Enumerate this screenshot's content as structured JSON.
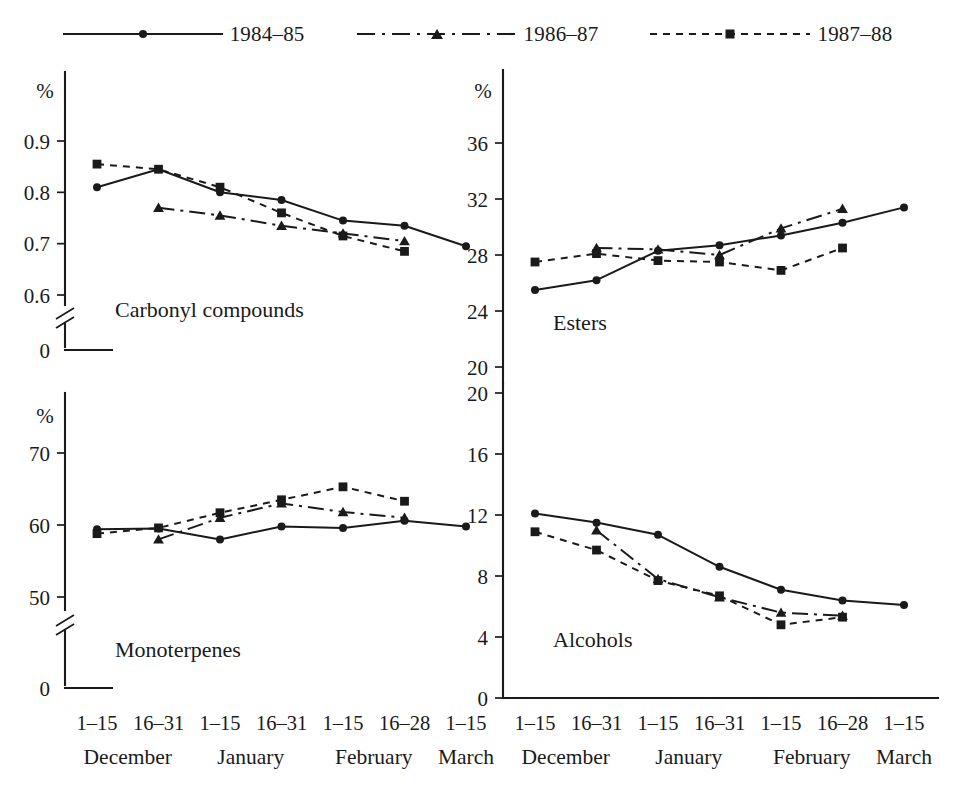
{
  "legend": {
    "entries": [
      {
        "label": "1984–85",
        "marker": "circle",
        "dash": "solid"
      },
      {
        "label": "1986–87",
        "marker": "triangle",
        "dash": "dashdot"
      },
      {
        "label": "1987–88",
        "marker": "square",
        "dash": "dotted"
      }
    ]
  },
  "axis": {
    "percent_symbol": "%",
    "zero_label": "0",
    "tick_labels": [
      "1–15",
      "16–31",
      "1–15",
      "16–31",
      "1–15",
      "16–28",
      "1–15"
    ],
    "month_labels": [
      "December",
      "January",
      "February",
      "March"
    ]
  },
  "chart_data": [
    {
      "type": "line",
      "title": "Carbonyl compounds",
      "xlabel": "",
      "ylabel": "%",
      "ylim": [
        0.55,
        0.93
      ],
      "yticks": [
        0.6,
        0.7,
        0.8,
        0.9
      ],
      "ytick_labels": [
        "0.6",
        "0.7",
        "0.8",
        "0.9"
      ],
      "axis_break": true,
      "grid": false,
      "legend_position": "top-center",
      "categories": [
        "1–15 December",
        "16–31 December",
        "1–15 January",
        "16–31 January",
        "1–15 February",
        "16–28 February",
        "1–15 March"
      ],
      "series": [
        {
          "name": "1984–85",
          "marker": "circle",
          "dash": "solid",
          "x": [
            0,
            1,
            2,
            3,
            4,
            5,
            6
          ],
          "values": [
            0.81,
            0.845,
            0.8,
            0.785,
            0.745,
            0.735,
            0.695
          ]
        },
        {
          "name": "1986–87",
          "marker": "triangle",
          "dash": "dashdot",
          "x": [
            1,
            2,
            3,
            4,
            5
          ],
          "values": [
            0.77,
            0.755,
            0.735,
            0.72,
            0.705
          ]
        },
        {
          "name": "1987–88",
          "marker": "square",
          "dash": "dotted",
          "x": [
            0,
            1,
            2,
            3,
            4,
            5
          ],
          "values": [
            0.855,
            0.845,
            0.81,
            0.76,
            0.715,
            0.685
          ]
        }
      ]
    },
    {
      "type": "line",
      "title": "Esters",
      "xlabel": "",
      "ylabel": "%",
      "ylim": [
        19.0,
        38.0
      ],
      "yticks": [
        20,
        24,
        28,
        32,
        36
      ],
      "ytick_labels": [
        "20",
        "24",
        "28",
        "32",
        "36"
      ],
      "axis_break": false,
      "grid": false,
      "legend_position": "top-center",
      "categories": [
        "1–15 December",
        "16–31 December",
        "1–15 January",
        "16–31 January",
        "1–15 February",
        "16–28 February",
        "1–15 March"
      ],
      "series": [
        {
          "name": "1984–85",
          "marker": "circle",
          "dash": "solid",
          "x": [
            0,
            1,
            2,
            3,
            4,
            5,
            6
          ],
          "values": [
            25.5,
            26.2,
            28.3,
            28.7,
            29.4,
            30.3,
            31.4
          ]
        },
        {
          "name": "1986–87",
          "marker": "triangle",
          "dash": "dashdot",
          "x": [
            1,
            2,
            3,
            4,
            5
          ],
          "values": [
            28.5,
            28.4,
            28.0,
            29.9,
            31.3
          ]
        },
        {
          "name": "1987–88",
          "marker": "square",
          "dash": "dotted",
          "x": [
            0,
            1,
            2,
            3,
            4,
            5
          ],
          "values": [
            27.5,
            28.1,
            27.6,
            27.5,
            26.9,
            28.5
          ]
        }
      ]
    },
    {
      "type": "line",
      "title": "Monoterpenes",
      "xlabel": "",
      "ylabel": "%",
      "ylim": [
        46.0,
        74.0
      ],
      "yticks": [
        50,
        60,
        70
      ],
      "ytick_labels": [
        "50",
        "60",
        "70"
      ],
      "axis_break": true,
      "grid": false,
      "legend_position": "top-center",
      "categories": [
        "1–15 December",
        "16–31 December",
        "1–15 January",
        "16–31 January",
        "1–15 February",
        "16–28 February",
        "1–15 March"
      ],
      "series": [
        {
          "name": "1984–85",
          "marker": "circle",
          "dash": "solid",
          "x": [
            0,
            1,
            2,
            3,
            4,
            5,
            6
          ],
          "values": [
            59.4,
            59.5,
            58.0,
            59.8,
            59.6,
            60.6,
            59.8
          ]
        },
        {
          "name": "1986–87",
          "marker": "triangle",
          "dash": "dashdot",
          "x": [
            1,
            2,
            3,
            4,
            5
          ],
          "values": [
            58.0,
            61.0,
            63.0,
            61.8,
            61.0
          ]
        },
        {
          "name": "1987–88",
          "marker": "square",
          "dash": "dotted",
          "x": [
            0,
            1,
            2,
            3,
            4,
            5
          ],
          "values": [
            58.8,
            59.6,
            61.7,
            63.5,
            65.3,
            63.3
          ]
        }
      ]
    },
    {
      "type": "line",
      "title": "Alcohols",
      "xlabel": "",
      "ylabel": "",
      "ylim": [
        0,
        21.5
      ],
      "yticks": [
        0,
        4,
        8,
        12,
        16,
        20
      ],
      "ytick_labels": [
        "0",
        "4",
        "8",
        "12",
        "16",
        "20"
      ],
      "axis_break": false,
      "grid": false,
      "legend_position": "top-center",
      "categories": [
        "1–15 December",
        "16–31 December",
        "1–15 January",
        "16–31 January",
        "1–15 February",
        "16–28 February",
        "1–15 March"
      ],
      "series": [
        {
          "name": "1984–85",
          "marker": "circle",
          "dash": "solid",
          "x": [
            0,
            1,
            2,
            3,
            4,
            5,
            6
          ],
          "values": [
            12.1,
            11.5,
            10.7,
            8.6,
            7.1,
            6.4,
            6.1
          ]
        },
        {
          "name": "1986–87",
          "marker": "triangle",
          "dash": "dashdot",
          "x": [
            1,
            2,
            3,
            4,
            5
          ],
          "values": [
            11.0,
            7.8,
            6.6,
            5.6,
            5.4
          ]
        },
        {
          "name": "1987–88",
          "marker": "square",
          "dash": "dotted",
          "x": [
            0,
            1,
            2,
            3,
            4,
            5
          ],
          "values": [
            10.9,
            9.7,
            7.7,
            6.7,
            4.8,
            5.3
          ]
        }
      ]
    }
  ]
}
